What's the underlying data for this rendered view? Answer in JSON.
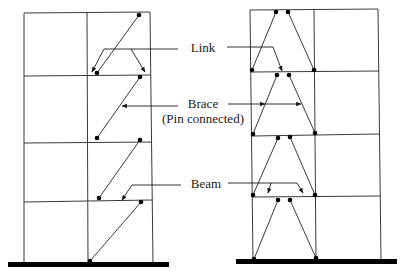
{
  "labels": {
    "link": "Link",
    "brace": "Brace",
    "brace_sub": "(Pin connected)",
    "beam": "Beam"
  },
  "colors": {
    "line": "#3a3a3a",
    "joint": "#000000",
    "ground": "#000000",
    "background": "#ffffff"
  },
  "frames": [
    {
      "name": "eccentric-single-diagonal-frame",
      "stories": 4,
      "bays": 2
    },
    {
      "name": "split-k-inverted-v-frame",
      "stories": 4,
      "bays": 2
    }
  ]
}
